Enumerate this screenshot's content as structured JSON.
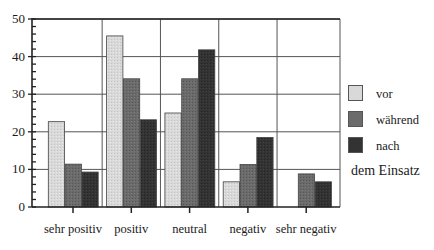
{
  "chart_data": {
    "type": "bar",
    "title": "",
    "xlabel": "",
    "ylabel": "",
    "ylim": [
      0,
      50
    ],
    "yticks": [
      0,
      10,
      20,
      30,
      40,
      50
    ],
    "ytick_labels": [
      "0",
      "10",
      "20",
      "30",
      "40",
      "50"
    ],
    "minor_ytick_step": 2,
    "grid": true,
    "categories": [
      "sehr positiv",
      "positiv",
      "neutral",
      "negativ",
      "sehr negativ"
    ],
    "series": [
      {
        "name": "vor",
        "color": "#d9d9d9",
        "values": [
          22.7,
          45.5,
          25.0,
          6.7,
          0
        ]
      },
      {
        "name": "während",
        "color": "#6b6b6b",
        "values": [
          11.4,
          34.1,
          34.1,
          11.3,
          8.8
        ]
      },
      {
        "name": "nach",
        "color": "#333333",
        "values": [
          9.3,
          23.2,
          41.8,
          18.5,
          6.7
        ]
      }
    ],
    "legend": {
      "position": "right",
      "entries": [
        "vor",
        "während",
        "nach"
      ],
      "title_below": "dem Einsatz"
    }
  }
}
